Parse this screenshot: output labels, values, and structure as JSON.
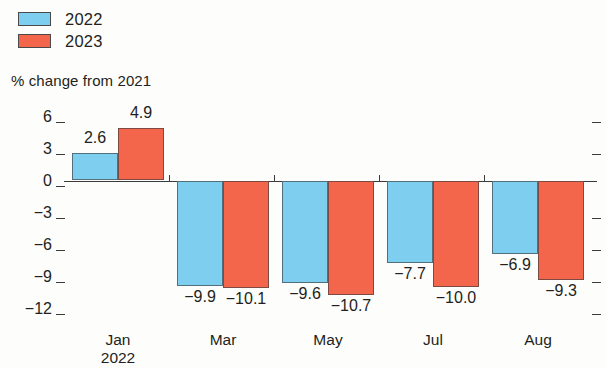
{
  "legend": {
    "items": [
      {
        "label": "2022",
        "color": "#7ECFEF"
      },
      {
        "label": "2023",
        "color": "#F4664B"
      }
    ]
  },
  "axis_title": "% change from 2021",
  "chart_data": {
    "type": "bar",
    "title": "",
    "subtitle": "",
    "xlabel": "",
    "ylabel": "% change from 2021",
    "categories": [
      "Jan\n2022",
      "Mar",
      "May",
      "Jul",
      "Aug"
    ],
    "category_labels": [
      {
        "line1": "Jan",
        "line2": "2022"
      },
      {
        "line1": "Mar",
        "line2": ""
      },
      {
        "line1": "May",
        "line2": ""
      },
      {
        "line1": "Jul",
        "line2": ""
      },
      {
        "line1": "Aug",
        "line2": ""
      }
    ],
    "series": [
      {
        "name": "2022",
        "color": "#7ECFEF",
        "values": [
          2.6,
          -9.9,
          -9.6,
          -7.7,
          -6.9
        ],
        "value_labels": [
          "2.6",
          "−9.9",
          "−9.6",
          "−7.7",
          "−6.9"
        ]
      },
      {
        "name": "2023",
        "color": "#F4664B",
        "values": [
          4.9,
          -10.1,
          -10.7,
          -10.0,
          -9.3
        ],
        "value_labels": [
          "4.9",
          "−10.1",
          "−10.7",
          "−10.0",
          "−9.3"
        ]
      }
    ],
    "ylim": [
      -12,
      6
    ],
    "yticks": [
      6,
      3,
      0,
      -3,
      -6,
      -9,
      -12
    ],
    "ytick_labels": [
      "6",
      "3",
      "0",
      "−3",
      "−6",
      "−9",
      "−12"
    ],
    "grid": false,
    "legend_position": "top-left"
  }
}
